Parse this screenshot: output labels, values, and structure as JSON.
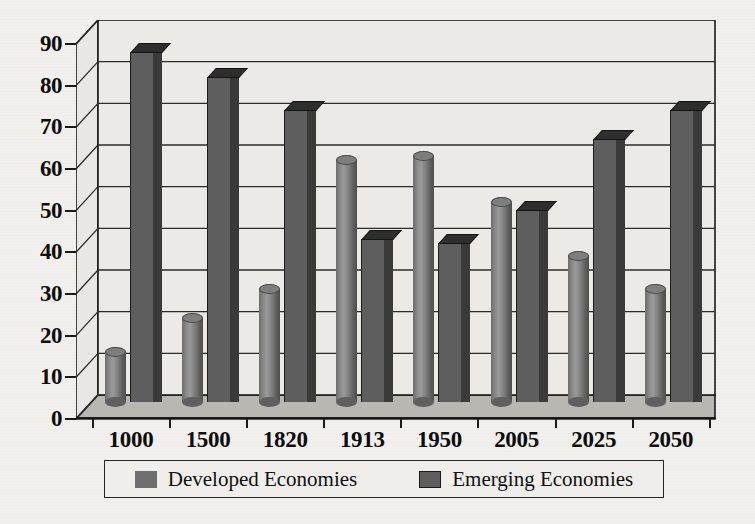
{
  "chart_data": {
    "type": "bar",
    "title": "",
    "subtitle": "",
    "xlabel": "",
    "ylabel": "",
    "ylim": [
      0,
      90
    ],
    "ytick_step": 10,
    "grid": true,
    "three_d": true,
    "legend_position": "bottom",
    "categories": [
      "1000",
      "1500",
      "1820",
      "1913",
      "1950",
      "2005",
      "2025",
      "2050"
    ],
    "yticks": [
      "0",
      "10",
      "20",
      "30",
      "40",
      "50",
      "60",
      "70",
      "80",
      "90"
    ],
    "series": [
      {
        "name": "Developed Economies",
        "shape": "cylinder",
        "color": "#7e7e7e",
        "values": [
          12,
          20,
          27,
          58,
          59,
          48,
          35,
          27
        ]
      },
      {
        "name": "Emerging Economies",
        "shape": "prism",
        "color": "#5e5e5e",
        "values": [
          84,
          78,
          70,
          39,
          38,
          46,
          63,
          70
        ]
      }
    ]
  },
  "legend": {
    "items": [
      {
        "label": "Developed Economies",
        "swatch": "developed-swatch-icon"
      },
      {
        "label": "Emerging Economies",
        "swatch": "emerging-swatch-icon"
      }
    ]
  },
  "colors": {
    "background": "#f1f0ec",
    "plot_background": "#eceae6",
    "axis": "#1a1a1a",
    "gridline": "#2a2a2a",
    "developed": "#7e7e7e",
    "emerging": "#5e5e5e"
  }
}
